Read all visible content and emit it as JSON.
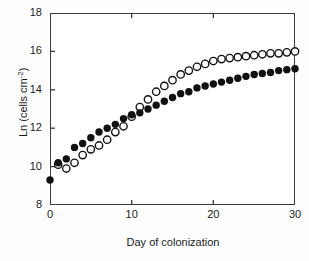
{
  "chart_data": {
    "type": "scatter",
    "title": "",
    "xlabel": "Day of colonization",
    "ylabel": "Ln (cells cm-2)",
    "ylabel_display": "Ln (cells cm",
    "ylabel_exponent": "-2",
    "ylabel_tail": ")",
    "xlim": [
      0,
      30
    ],
    "ylim": [
      8,
      18
    ],
    "xticks": [
      0,
      10,
      20,
      30
    ],
    "yticks": [
      8,
      10,
      12,
      14,
      16,
      18
    ],
    "xtick_labels": [
      "0",
      "10",
      "20",
      "30"
    ],
    "ytick_labels": [
      "8",
      "10",
      "12",
      "14",
      "16",
      "18"
    ],
    "grid": false,
    "legend": "none",
    "marker_size_px": 5.6,
    "series": [
      {
        "name": "filled-circles",
        "marker": "filled-circle",
        "color": "#111111",
        "x": [
          0,
          1,
          2,
          3,
          4,
          5,
          6,
          7,
          8,
          9,
          10,
          11,
          12,
          13,
          14,
          15,
          16,
          17,
          18,
          19,
          20,
          21,
          22,
          23,
          24,
          25,
          26,
          27,
          28,
          29,
          30
        ],
        "values": [
          9.3,
          10.2,
          10.4,
          11.0,
          11.2,
          11.5,
          11.8,
          12.0,
          12.2,
          12.5,
          12.7,
          12.8,
          13.0,
          13.2,
          13.4,
          13.6,
          13.8,
          13.9,
          14.1,
          14.2,
          14.3,
          14.4,
          14.5,
          14.6,
          14.7,
          14.8,
          14.85,
          14.9,
          15.0,
          15.05,
          15.1
        ]
      },
      {
        "name": "open-circles",
        "marker": "open-circle",
        "color": "#111111",
        "x": [
          1,
          2,
          3,
          4,
          5,
          6,
          7,
          8,
          9,
          10,
          11,
          12,
          13,
          14,
          15,
          16,
          17,
          18,
          19,
          20,
          21,
          22,
          23,
          24,
          25,
          26,
          27,
          28,
          29,
          30
        ],
        "values": [
          10.1,
          9.9,
          10.2,
          10.6,
          10.9,
          11.1,
          11.4,
          11.8,
          12.1,
          12.6,
          13.1,
          13.5,
          13.9,
          14.2,
          14.5,
          14.8,
          15.0,
          15.2,
          15.35,
          15.5,
          15.6,
          15.65,
          15.7,
          15.75,
          15.8,
          15.85,
          15.9,
          15.9,
          15.95,
          16.0
        ]
      }
    ]
  },
  "figure": {
    "background": "#ffffff",
    "axis_color": "#3a3a3a",
    "text_color": "#1a1a1a"
  }
}
